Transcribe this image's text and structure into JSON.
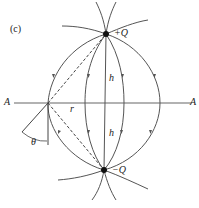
{
  "panel_label": "(c)",
  "charges": {
    "positive": "+Q",
    "negative": "−Q"
  },
  "axis": {
    "left_label": "A",
    "right_label": "A"
  },
  "distances": {
    "h_upper": "h",
    "h_lower": "h",
    "r": "r"
  },
  "angle": "θ",
  "colors": {
    "field_line": "#555555",
    "charge": "#111111",
    "axis": "#666666"
  }
}
